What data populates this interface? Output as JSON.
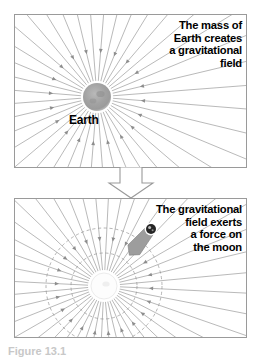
{
  "figure": {
    "caption": "Figure 13.1",
    "panels": [
      {
        "id": "top",
        "object_label": "Earth",
        "callout_lines": [
          "The mass of",
          "Earth creates",
          "a gravitational",
          "field"
        ]
      },
      {
        "id": "bottom",
        "object_label": "",
        "callout_lines": [
          "The gravitational",
          "field exerts",
          "a force on",
          "the moon"
        ]
      }
    ],
    "connector": {
      "icon": "down-block-arrow-icon"
    },
    "colors": {
      "field_line": "#8d8d8d",
      "panel_border": "#9a9a9a",
      "earth_body": "#9b9b9b",
      "moon_body": "#262626",
      "force_arrow": "#9d9d9d",
      "dashed_circle": "#a8a8a8",
      "text": "#000000",
      "caption_text": "#c8c8c8"
    },
    "diagram_geometry": {
      "top_panel": {
        "center_x": 82,
        "center_y": 82,
        "earth_radius": 14,
        "line_count": 40
      },
      "bottom_panel": {
        "center_x": 89,
        "center_y": 87,
        "earth_radius": 13,
        "line_count": 44,
        "dashed_circle_radii": [
          33,
          58
        ],
        "moon": {
          "x": 136,
          "y": 30,
          "radius": 5
        }
      }
    }
  }
}
